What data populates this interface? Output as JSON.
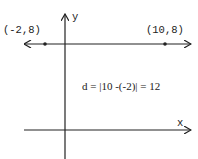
{
  "diagram": {
    "axes": {
      "x_label": "x",
      "y_label": "y"
    },
    "points": [
      {
        "label": "(-2,8)",
        "x": -2,
        "y": 8
      },
      {
        "label": "(10,8)",
        "x": 10,
        "y": 8
      }
    ],
    "formula": "d = |10 -(-2)| = 12",
    "colors": {
      "ink": "#222222",
      "background": "#ffffff"
    }
  }
}
